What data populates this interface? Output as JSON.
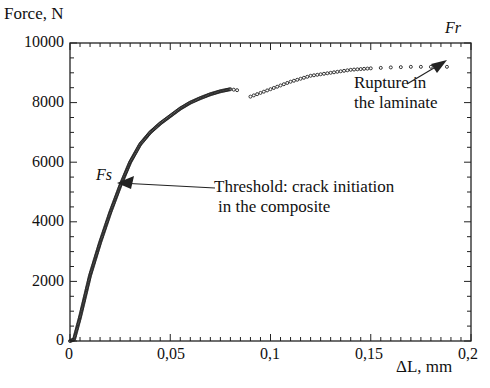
{
  "chart_data": {
    "type": "scatter",
    "title": "",
    "xlabel": "ΔL, mm",
    "ylabel": "Force, N",
    "xlim": [
      0,
      0.2
    ],
    "ylim": [
      0,
      10000
    ],
    "x_ticks": [
      "0",
      "0,05",
      "0,1",
      "0,15",
      "0,2"
    ],
    "y_ticks": [
      "0",
      "2000",
      "4000",
      "6000",
      "8000",
      "10000"
    ],
    "grid": false,
    "legend": null,
    "series": [
      {
        "name": "force-displacement",
        "x": [
          0,
          0.002,
          0.005,
          0.01,
          0.015,
          0.02,
          0.025,
          0.03,
          0.035,
          0.04,
          0.045,
          0.05,
          0.055,
          0.06,
          0.065,
          0.07,
          0.075,
          0.08,
          0.085,
          0.09,
          0.1,
          0.11,
          0.12,
          0.13,
          0.14,
          0.15,
          0.16,
          0.17,
          0.18,
          0.188
        ],
        "y": [
          0,
          50,
          800,
          2200,
          3300,
          4300,
          5200,
          6000,
          6600,
          7000,
          7300,
          7550,
          7800,
          8000,
          8150,
          8280,
          8380,
          8450,
          8400,
          8200,
          8450,
          8700,
          8900,
          9000,
          9100,
          9150,
          9180,
          9200,
          9200,
          9200
        ]
      }
    ],
    "annotations": [
      {
        "label": "Fs",
        "x": 0.025,
        "y": 5200,
        "text": "Threshold: crack initiation\nin the composite"
      },
      {
        "label": "Fr",
        "x": 0.188,
        "y": 9200,
        "text": "Rupture in\nthe laminate"
      }
    ]
  },
  "labels": {
    "ylabel": "Force, N",
    "xlabel": "ΔL, mm",
    "fs": "Fs",
    "fr": "Fr",
    "threshold_line1": "Threshold: crack initiation",
    "threshold_line2": "in the composite",
    "rupture_line1": "Rupture in",
    "rupture_line2": "the laminate"
  }
}
